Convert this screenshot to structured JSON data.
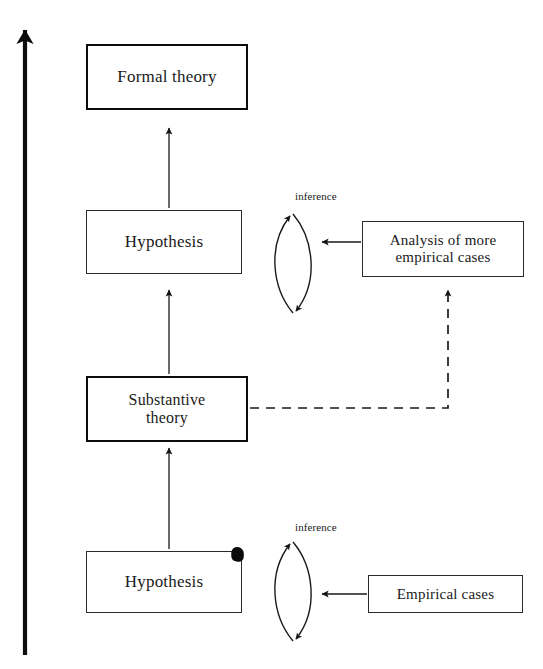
{
  "diagram": {
    "background_color": "#ffffff",
    "ink_color": "#1a1a1a",
    "nodes": [
      {
        "id": "formal-theory",
        "label": "Formal theory",
        "border": "thick",
        "x": 86,
        "y": 44,
        "w": 162,
        "h": 66,
        "font_size": 17
      },
      {
        "id": "hypothesis-upper",
        "label": "Hypothesis",
        "border": "thin",
        "x": 86,
        "y": 210,
        "w": 156,
        "h": 64,
        "font_size": 17
      },
      {
        "id": "analysis-more-cases",
        "label": "Analysis of more\nempirical cases",
        "border": "thin",
        "x": 362,
        "y": 221,
        "w": 162,
        "h": 56,
        "font_size": 15
      },
      {
        "id": "substantive-theory",
        "label": "Substantive\ntheory",
        "border": "thick",
        "x": 86,
        "y": 376,
        "w": 162,
        "h": 66,
        "font_size": 16
      },
      {
        "id": "hypothesis-lower",
        "label": "Hypothesis",
        "border": "thin",
        "x": 86,
        "y": 551,
        "w": 156,
        "h": 62,
        "font_size": 17
      },
      {
        "id": "empirical-cases",
        "label": "Empirical cases",
        "border": "thin",
        "x": 368,
        "y": 575,
        "w": 155,
        "h": 38,
        "font_size": 15
      }
    ],
    "edge_labels": [
      {
        "id": "inference-upper",
        "text": "inference",
        "x": 295,
        "y": 190
      },
      {
        "id": "inference-lower",
        "text": "inference",
        "x": 295,
        "y": 521
      }
    ],
    "lenses": [
      {
        "id": "inference-lens-upper",
        "cx": 293,
        "top": 212,
        "bottom": 315,
        "half_width": 26
      },
      {
        "id": "inference-lens-lower",
        "cx": 293,
        "top": 541,
        "bottom": 643,
        "half_width": 26
      }
    ],
    "arrows": [
      {
        "id": "progression-arrow",
        "from": [
          25,
          655
        ],
        "to": [
          25,
          21
        ],
        "style": "solid",
        "weight": "heavy"
      },
      {
        "id": "hypothesis-to-formal-theory",
        "from": [
          169,
          208
        ],
        "to": [
          169,
          126
        ],
        "style": "solid",
        "weight": "light"
      },
      {
        "id": "substantive-to-hypothesis",
        "from": [
          169,
          374
        ],
        "to": [
          169,
          288
        ],
        "style": "solid",
        "weight": "light"
      },
      {
        "id": "lower-hypothesis-to-substantive",
        "from": [
          169,
          549
        ],
        "to": [
          169,
          446
        ],
        "style": "solid",
        "weight": "light"
      },
      {
        "id": "analysis-to-inference-upper",
        "from": [
          360,
          242
        ],
        "to": [
          320,
          242
        ],
        "style": "solid",
        "weight": "light"
      },
      {
        "id": "empirical-cases-to-inference-lower",
        "from": [
          366,
          594
        ],
        "to": [
          320,
          594
        ],
        "style": "solid",
        "weight": "light"
      },
      {
        "id": "substantive-to-analysis-dashed",
        "path": [
          [
            250,
            408
          ],
          [
            448,
            408
          ],
          [
            448,
            288
          ]
        ],
        "style": "dashed",
        "weight": "light"
      }
    ],
    "artifacts": [
      {
        "id": "ink-smudge",
        "x": 231,
        "y": 547,
        "w": 13,
        "h": 15
      }
    ]
  }
}
